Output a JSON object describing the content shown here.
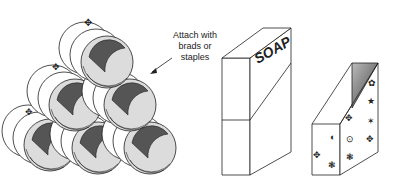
{
  "figure": {
    "annotation": {
      "line1": "Attach with",
      "line2": "brads or",
      "line3": "staples"
    },
    "box_label": "SOAP",
    "panels": [
      {
        "name": "stacked-tubes",
        "description": "Six cylinders stacked in a pyramid (1-2-3) with decorated rims"
      },
      {
        "name": "soap-box",
        "description": "Box labeled SOAP cut diagonally"
      },
      {
        "name": "decorated-holder",
        "description": "Diagonally cut box decorated with stamped shapes"
      }
    ],
    "colors": {
      "stroke": "#222222",
      "tube_fill": "#dcdcdc",
      "tube_inner": "#555555",
      "paper": "#ffffff"
    }
  }
}
